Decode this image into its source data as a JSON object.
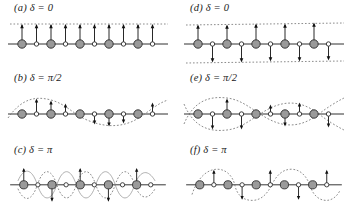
{
  "figure": {
    "background_color": "#ffffff",
    "width": 351,
    "height": 216
  },
  "style": {
    "line_color": "#1a1a1a",
    "heavy_atom_fill": "#9a9a9a",
    "heavy_atom_stroke": "#2b2b2b",
    "light_atom_fill": "#ffffff",
    "light_atom_stroke": "#2b2b2b",
    "envelope_color": "#6e6e6e",
    "curve_color": "#8a8a8a",
    "arrow_color": "#111111"
  },
  "panels": [
    {
      "id": "a",
      "label": "(a)  δ = 0",
      "tag": "(a)",
      "symbol": "δ",
      "equals": "=",
      "value": "0",
      "column": "left",
      "row": 0,
      "arrow_pattern": "all-up-equal",
      "envelope": "single-dashed-above",
      "curves": []
    },
    {
      "id": "b",
      "label": "(b)  δ = π/2",
      "tag": "(b)",
      "symbol": "δ",
      "equals": "=",
      "value": "π/2",
      "column": "left",
      "row": 1,
      "arrow_pattern": "sine-modulated",
      "envelope": "single-dashed-sine",
      "curves": [
        "sine-1period"
      ]
    },
    {
      "id": "c",
      "label": "(c)  δ = π",
      "tag": "(c)",
      "symbol": "δ",
      "equals": "=",
      "value": "π",
      "column": "left",
      "row": 2,
      "arrow_pattern": "alternating-up-down",
      "envelope": "double-crossing-high-frequency",
      "curves": [
        "sine-high-solid",
        "sine-high-dashed"
      ]
    },
    {
      "id": "d",
      "label": "(d)  δ = 0",
      "tag": "(d)",
      "symbol": "δ",
      "equals": "=",
      "value": "0",
      "column": "right",
      "row": 0,
      "arrow_pattern": "heavy-up-light-down",
      "envelope": "two-dashed-horizontal",
      "curves": []
    },
    {
      "id": "e",
      "label": "(e)  δ = π/2",
      "tag": "(e)",
      "symbol": "δ",
      "equals": "=",
      "value": "π/2",
      "column": "right",
      "row": 1,
      "arrow_pattern": "opposed-sine",
      "envelope": "two-dashed-sine-crossing",
      "curves": [
        "sine-up",
        "sine-down"
      ]
    },
    {
      "id": "f",
      "label": "(f)  δ = π",
      "tag": "(f)",
      "symbol": "δ",
      "equals": "=",
      "value": "π",
      "column": "right",
      "row": 2,
      "arrow_pattern": "alternating-sine-opposed",
      "envelope": "single-dashed-sine-short",
      "curves": [
        "sine-2period-dashed"
      ]
    }
  ],
  "lattice": {
    "heavy_atom_count": 5,
    "light_atom_count": 5,
    "heavy_atom_radius": 4.2,
    "light_atom_radius": 2.2,
    "spacing": 14.5,
    "start_x": 22,
    "baseline_y": 44
  }
}
